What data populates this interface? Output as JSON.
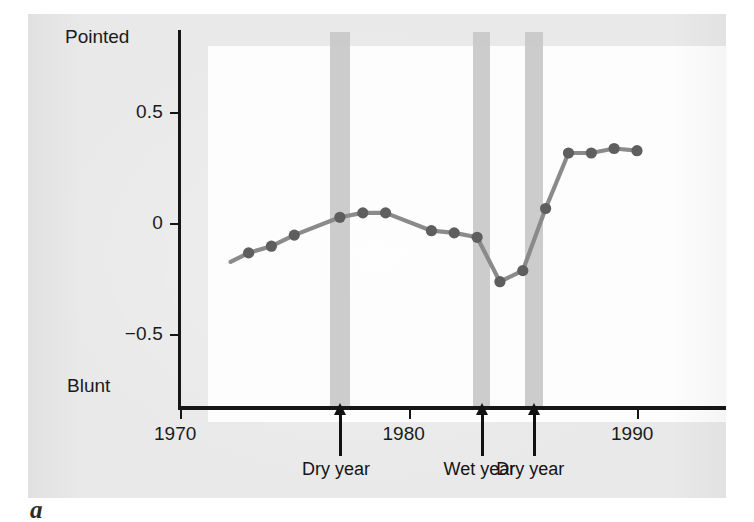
{
  "figure": {
    "caption": "a",
    "axis_top_label": "Pointed",
    "axis_bottom_label": "Blunt",
    "series_color": "#8a8a8a",
    "marker_color": "#5e5e5e",
    "band_color": "#c9c9c9",
    "panel_background": "#e9e9e9",
    "plot_background": "#fdfdfd"
  },
  "chart_data": {
    "type": "line",
    "title": "",
    "xlabel": "",
    "ylabel": "",
    "xlim": [
      1970,
      1990
    ],
    "ylim": [
      -0.78,
      0.82
    ],
    "grid": false,
    "legend": "none",
    "xticks": [
      "1970",
      "1980",
      "1990"
    ],
    "xtick_values": [
      1970,
      1980,
      1990
    ],
    "yticks": [
      "0.5",
      "0",
      "−0.5"
    ],
    "ytick_values": [
      0.5,
      0,
      -0.5
    ],
    "y_axis_endpoints": {
      "high": "Pointed",
      "low": "Blunt"
    },
    "x": [
      1973,
      1974,
      1975,
      1977,
      1978,
      1979,
      1981,
      1982,
      1983,
      1984,
      1985,
      1986,
      1987,
      1988,
      1989,
      1990
    ],
    "values": [
      -0.13,
      -0.1,
      -0.05,
      0.03,
      0.05,
      0.05,
      -0.03,
      -0.04,
      -0.06,
      -0.26,
      -0.21,
      0.07,
      0.32,
      0.32,
      0.34,
      0.33
    ],
    "series": [
      {
        "name": "Beak shape (pointed – blunt)",
        "x": [
          1973,
          1974,
          1975,
          1977,
          1978,
          1979,
          1981,
          1982,
          1983,
          1984,
          1985,
          1986,
          1987,
          1988,
          1989,
          1990
        ],
        "values": [
          -0.13,
          -0.1,
          -0.05,
          0.03,
          0.05,
          0.05,
          -0.03,
          -0.04,
          -0.06,
          -0.26,
          -0.21,
          0.07,
          0.32,
          0.32,
          0.34,
          0.33
        ]
      }
    ],
    "annotations": [
      {
        "label": "Dry year",
        "x": 1977.0
      },
      {
        "label": "Wet year",
        "x": 1983.2
      },
      {
        "label": "Dry year",
        "x": 1985.5
      }
    ],
    "shaded_bands": [
      {
        "label": "Dry year",
        "center": 1977.0,
        "width": 0.85
      },
      {
        "label": "Wet year",
        "center": 1983.2,
        "width": 0.75
      },
      {
        "label": "Dry year",
        "center": 1985.5,
        "width": 0.78
      }
    ]
  }
}
